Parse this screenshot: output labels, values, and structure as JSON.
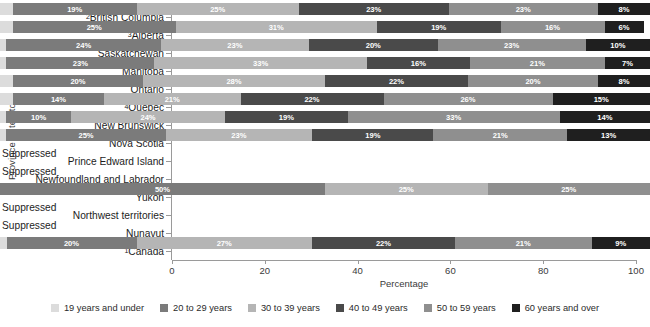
{
  "chart_data": {
    "type": "bar",
    "orientation": "horizontal",
    "stacked": true,
    "title": "",
    "xlabel": "Percentage",
    "ylabel": "Province or territory",
    "xlim": [
      0,
      100
    ],
    "xticks": [
      0,
      20,
      40,
      60,
      80,
      100
    ],
    "grid": false,
    "legend_position": "bottom",
    "suppressed_text": "Suppressed",
    "categories": [
      "British Columbia",
      "Alberta",
      "Saskatchewan",
      "Manitoba",
      "Ontario",
      "Quebec",
      "New Brunswick",
      "Nova Scotia",
      "Prince Edward Island",
      "Newfoundland and Labrador",
      "Yukon",
      "Northwest territories",
      "Nunavut",
      "Canada"
    ],
    "category_footnotes": {
      "British Columbia": "2",
      "Alberta": "3",
      "Quebec": "4",
      "Canada": "1"
    },
    "series": [
      {
        "name": "19 years and under",
        "color": "#dcdcdc",
        "values": [
          2,
          2,
          1,
          1,
          2,
          2,
          1,
          1,
          null,
          null,
          0,
          null,
          null,
          1
        ]
      },
      {
        "name": "20 to 29 years",
        "color": "#7b7b7b",
        "values": [
          19,
          25,
          24,
          23,
          20,
          14,
          10,
          25,
          null,
          null,
          50,
          null,
          null,
          20
        ]
      },
      {
        "name": "30 to 39 years",
        "color": "#b5b5b5",
        "values": [
          25,
          31,
          23,
          33,
          28,
          21,
          24,
          23,
          null,
          null,
          25,
          null,
          null,
          27
        ]
      },
      {
        "name": "40 to 49 years",
        "color": "#4a4a4a",
        "values": [
          23,
          19,
          20,
          16,
          22,
          22,
          19,
          19,
          null,
          null,
          0,
          null,
          null,
          22
        ]
      },
      {
        "name": "50 to 59 years",
        "color": "#8f8f8f",
        "values": [
          23,
          16,
          23,
          21,
          20,
          26,
          33,
          21,
          null,
          null,
          25,
          null,
          null,
          21
        ]
      },
      {
        "name": "60 years and over",
        "color": "#1f1f1f",
        "values": [
          8,
          6,
          10,
          7,
          8,
          15,
          14,
          13,
          null,
          null,
          0,
          null,
          null,
          9
        ]
      }
    ],
    "bar_labels": {
      "British Columbia": [
        "",
        "19%",
        "25%",
        "23%",
        "23%",
        "8%"
      ],
      "Alberta": [
        "",
        "25%",
        "31%",
        "19%",
        "16%",
        "6%"
      ],
      "Saskatchewan": [
        "",
        "24%",
        "23%",
        "20%",
        "23%",
        "10%"
      ],
      "Manitoba": [
        "",
        "23%",
        "33%",
        "16%",
        "21%",
        "7%"
      ],
      "Ontario": [
        "",
        "20%",
        "28%",
        "22%",
        "20%",
        "8%"
      ],
      "Quebec": [
        "",
        "14%",
        "21%",
        "22%",
        "26%",
        "15%"
      ],
      "New Brunswick": [
        "",
        "10%",
        "24%",
        "19%",
        "33%",
        "14%"
      ],
      "Nova Scotia": [
        "",
        "25%",
        "23%",
        "19%",
        "21%",
        "13%"
      ],
      "Yukon": [
        "",
        "50%",
        "25%",
        "",
        "25%",
        ""
      ],
      "Canada": [
        "",
        "20%",
        "27%",
        "22%",
        "21%",
        "9%"
      ]
    },
    "suppressed_categories": [
      "Prince Edward Island",
      "Newfoundland and Labrador",
      "Northwest territories",
      "Nunavut"
    ]
  }
}
